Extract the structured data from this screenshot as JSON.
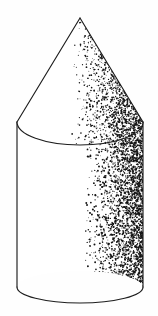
{
  "figure": {
    "shape_names": [
      "cone",
      "cylinder"
    ],
    "render_style": "pen-and-ink stipple shading",
    "background_color": "#fefefe",
    "ink_color": "#1d1d1d",
    "stipple_color": "#141414",
    "canvas": {
      "width": 158,
      "height": 316
    }
  },
  "geometry": {
    "cone": {
      "apex": {
        "x": 80,
        "y": 18
      },
      "base_left": {
        "x": 17,
        "y": 122
      },
      "base_right": {
        "x": 143,
        "y": 122
      },
      "base_ellipse_ry": 23,
      "base_ellipse_rx": 63,
      "base_center": {
        "x": 80,
        "y": 122
      }
    },
    "cylinder": {
      "left_x": 17,
      "right_x": 143,
      "top_y": 122,
      "bottom_y": 287,
      "bottom_ellipse_rx": 63,
      "bottom_ellipse_ry": 16
    }
  },
  "shading": {
    "type": "stipple",
    "light_direction": "upper-left",
    "cone": {
      "start_x_fraction": 0.42,
      "max_density": 1.0,
      "dot_count": 2600,
      "dot_radius_range": [
        0.35,
        0.95
      ]
    },
    "cylinder": {
      "start_x_fraction": 0.5,
      "max_density": 1.0,
      "dot_count": 3400,
      "dot_radius_range": [
        0.35,
        1.0
      ]
    }
  },
  "labels": {
    "alt_text": "Cone mounted on a cylinder, ink drawing with stipple shading"
  }
}
